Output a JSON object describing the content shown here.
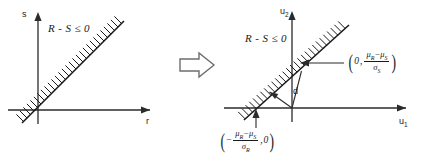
{
  "figure": {
    "width": 424,
    "height": 161,
    "background": "#ffffff",
    "line_color": "#1a1a1a",
    "axis_color": "#2b2b2b",
    "arrow_color": "#6e6e6e"
  },
  "left_panel": {
    "name": "basic-variable-space",
    "y_axis_label": "s",
    "x_axis_label": "r",
    "region_label": "R - S ≤ 0",
    "failure_line_note": "r = s",
    "hatching_side": "upper-left"
  },
  "transform_arrow": {
    "name": "transformation-arrow",
    "direction": "right",
    "style": "open block arrow"
  },
  "right_panel": {
    "name": "standard-normal-space",
    "y_axis_label": "u",
    "y_axis_subscript": "2",
    "x_axis_label": "u",
    "x_axis_subscript": "1",
    "region_label": "R - S ≤ 0",
    "distance_label": "d",
    "hatching_side": "upper-left",
    "y_intercept": {
      "open_paren": "(",
      "first": "0",
      "comma": ",",
      "numerator_mu_r": "μ",
      "numerator_sub_r": "R",
      "numerator_minus": "−",
      "numerator_mu_s": "μ",
      "numerator_sub_s": "S",
      "denominator_sigma": "σ",
      "denominator_sub": "S",
      "close_paren": ")"
    },
    "x_intercept": {
      "open_paren": "(",
      "leading_minus": "−",
      "numerator_mu_r": "μ",
      "numerator_sub_r": "R",
      "numerator_minus": "−",
      "numerator_mu_s": "μ",
      "numerator_sub_s": "S",
      "denominator_sigma": "σ",
      "denominator_sub": "R",
      "comma": ",",
      "last": "0",
      "close_paren": ")"
    }
  }
}
